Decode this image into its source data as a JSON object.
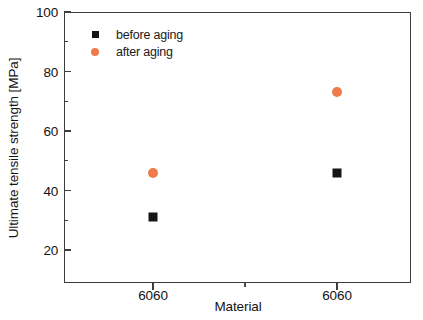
{
  "chart_data": {
    "type": "scatter",
    "title": "",
    "xlabel": "Material",
    "ylabel": "Ultimate tensile strength [MPa]",
    "categories": [
      "6060",
      "6060"
    ],
    "ylim": [
      12,
      100
    ],
    "ytick_labels": [
      "100",
      "80",
      "60",
      "40",
      "20"
    ],
    "ytick_values": [
      100,
      80,
      60,
      40,
      20
    ],
    "yminor_values": [
      90,
      70,
      50,
      30
    ],
    "grid": false,
    "legend_position": "upper left",
    "series": [
      {
        "name": "before aging",
        "marker": "square",
        "color": "#151515",
        "values": [
          31,
          46
        ]
      },
      {
        "name": "after aging",
        "marker": "circle",
        "color": "#f07a4b",
        "values": [
          46,
          73
        ]
      }
    ]
  },
  "legend": {
    "items": [
      {
        "label": "before aging"
      },
      {
        "label": "after aging"
      }
    ]
  },
  "axis": {
    "x_title": "Material",
    "y_title": "Ultimate tensile strength [MPa]",
    "x_tick_labels": [
      "6060",
      "6060"
    ],
    "y_tick_labels": [
      "100",
      "80",
      "60",
      "40",
      "20"
    ]
  }
}
